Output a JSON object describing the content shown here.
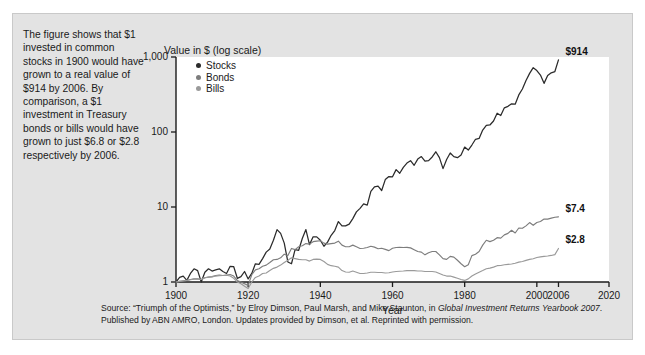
{
  "caption": {
    "text": "The figure shows that $1 invested in common stocks in 1900 would have grown to a real value of $914 by 2006.  By comparison, a $1 investment in Treasury bonds or bills would have grown to just $6.8 or $2.8 respectively by 2006."
  },
  "source": {
    "line1_a": "Source: “Triumph of the Optimists,” by Elroy Dimson, Paul Marsh, and Mike Staunton, in ",
    "line1_ital": "Global Investment Returns",
    "line2_ital": "Yearbook 2007",
    "line2_b": ". Published by ABN AMRO, London. Updates provided by Dimson, et al. Reprinted with permission."
  },
  "colors": {
    "stocks": "#2b2b2b",
    "bonds": "#7d7d7d",
    "bills": "#9a9a9a",
    "axis": "#1a1a1a",
    "figure_bg": "#e3e3e3",
    "plot_bg": "#ffffff"
  },
  "chart_data": {
    "type": "line",
    "title": "",
    "ylabel": "Value in $ (log scale)",
    "xlabel": "Year",
    "yscale": "log",
    "ylim": [
      1,
      1000
    ],
    "xlim": [
      1900,
      2020
    ],
    "grid": false,
    "legend_position": "top-left-inside",
    "ytick_labels": [
      "1,000",
      "100",
      "10",
      "1"
    ],
    "ytick_values": [
      1000,
      100,
      10,
      1
    ],
    "xtick_labels": [
      "1900",
      "1920",
      "1940",
      "1960",
      "1980",
      "2000",
      "2006",
      "2020"
    ],
    "xtick_values": [
      1900,
      1920,
      1940,
      1960,
      1980,
      2000,
      2006,
      2020
    ],
    "annotations": [
      {
        "text": "$914",
        "series": "Stocks",
        "x": 2006,
        "y": 914
      },
      {
        "text": "$7.4",
        "series": "Bonds",
        "x": 2006,
        "y": 7.4
      },
      {
        "text": "$2.8",
        "series": "Bills",
        "x": 2006,
        "y": 2.8
      }
    ],
    "legend": [
      {
        "label": "Stocks",
        "color": "#2b2b2b"
      },
      {
        "label": "Bonds",
        "color": "#7d7d7d"
      },
      {
        "label": "Bills",
        "color": "#9a9a9a"
      }
    ],
    "x": [
      1900,
      1901,
      1902,
      1903,
      1904,
      1905,
      1906,
      1907,
      1908,
      1909,
      1910,
      1911,
      1912,
      1913,
      1914,
      1915,
      1916,
      1917,
      1918,
      1919,
      1920,
      1921,
      1922,
      1923,
      1924,
      1925,
      1926,
      1927,
      1928,
      1929,
      1930,
      1931,
      1932,
      1933,
      1934,
      1935,
      1936,
      1937,
      1938,
      1939,
      1940,
      1941,
      1942,
      1943,
      1944,
      1945,
      1946,
      1947,
      1948,
      1949,
      1950,
      1951,
      1952,
      1953,
      1954,
      1955,
      1956,
      1957,
      1958,
      1959,
      1960,
      1961,
      1962,
      1963,
      1964,
      1965,
      1966,
      1967,
      1968,
      1969,
      1970,
      1971,
      1972,
      1973,
      1974,
      1975,
      1976,
      1977,
      1978,
      1979,
      1980,
      1981,
      1982,
      1983,
      1984,
      1985,
      1986,
      1987,
      1988,
      1989,
      1990,
      1991,
      1992,
      1993,
      1994,
      1995,
      1996,
      1997,
      1998,
      1999,
      2000,
      2001,
      2002,
      2003,
      2004,
      2005,
      2006
    ],
    "series": [
      {
        "name": "Stocks",
        "color": "#2b2b2b",
        "values": [
          1.0,
          1.15,
          1.2,
          1.05,
          1.3,
          1.5,
          1.42,
          1.0,
          1.35,
          1.5,
          1.4,
          1.45,
          1.5,
          1.38,
          1.3,
          1.62,
          1.6,
          1.12,
          1.18,
          1.38,
          1.1,
          1.3,
          1.75,
          1.72,
          2.05,
          2.5,
          2.75,
          3.6,
          5.0,
          4.45,
          3.3,
          1.85,
          1.75,
          2.7,
          2.65,
          3.8,
          5.0,
          3.15,
          4.0,
          4.0,
          3.6,
          3.0,
          3.4,
          4.2,
          4.85,
          6.4,
          5.6,
          5.6,
          5.9,
          7.0,
          8.6,
          9.6,
          11.0,
          10.6,
          16.2,
          18.6,
          19.0,
          16.6,
          23.2,
          25.5,
          25.3,
          31.5,
          28.2,
          33.8,
          38.5,
          41.5,
          36.0,
          43.5,
          47.0,
          41.0,
          41.5,
          46.5,
          54.5,
          45.5,
          32.5,
          43.0,
          52.5,
          47.0,
          45.5,
          49.5,
          63.0,
          57.5,
          67.0,
          80.0,
          82.0,
          106.0,
          123.0,
          124.0,
          140.0,
          178.0,
          166.0,
          210.0,
          220.0,
          238.0,
          235.0,
          312.0,
          375.0,
          485.0,
          605.0,
          720.0,
          660.0,
          575.0,
          445.0,
          565.0,
          615.0,
          640.0,
          914.0
        ]
      },
      {
        "name": "Bonds",
        "color": "#7d7d7d",
        "values": [
          1.0,
          1.02,
          1.04,
          1.05,
          1.08,
          1.1,
          1.1,
          1.08,
          1.14,
          1.16,
          1.18,
          1.22,
          1.24,
          1.22,
          1.24,
          1.26,
          1.2,
          1.05,
          1.0,
          0.95,
          0.9,
          1.25,
          1.45,
          1.5,
          1.62,
          1.68,
          1.82,
          1.98,
          2.0,
          2.1,
          2.35,
          2.25,
          2.8,
          2.7,
          2.95,
          3.05,
          3.25,
          3.2,
          3.45,
          3.5,
          3.55,
          3.3,
          3.2,
          3.25,
          3.3,
          3.5,
          3.1,
          2.95,
          2.95,
          3.1,
          2.95,
          2.8,
          2.82,
          2.88,
          3.0,
          2.92,
          2.78,
          2.82,
          2.72,
          2.62,
          2.82,
          2.88,
          2.9,
          2.88,
          2.9,
          2.85,
          2.7,
          2.55,
          2.5,
          2.3,
          2.45,
          2.55,
          2.55,
          2.3,
          2.05,
          2.0,
          2.2,
          2.15,
          1.95,
          1.75,
          1.6,
          1.7,
          2.25,
          2.35,
          2.55,
          3.1,
          3.6,
          3.45,
          3.6,
          3.9,
          3.85,
          4.25,
          4.45,
          4.9,
          4.5,
          5.25,
          5.2,
          5.6,
          6.2,
          5.7,
          6.2,
          6.4,
          6.9,
          6.9,
          7.1,
          7.3,
          7.4
        ]
      },
      {
        "name": "Bills",
        "color": "#9a9a9a",
        "values": [
          1.0,
          1.02,
          1.03,
          1.05,
          1.07,
          1.09,
          1.1,
          1.08,
          1.14,
          1.16,
          1.17,
          1.2,
          1.21,
          1.22,
          1.23,
          1.2,
          1.12,
          1.0,
          0.95,
          0.88,
          0.82,
          1.0,
          1.15,
          1.2,
          1.3,
          1.32,
          1.42,
          1.52,
          1.58,
          1.68,
          1.82,
          1.95,
          2.1,
          2.05,
          2.0,
          1.98,
          1.98,
          1.9,
          2.0,
          2.02,
          2.0,
          1.88,
          1.72,
          1.65,
          1.62,
          1.58,
          1.42,
          1.36,
          1.35,
          1.4,
          1.35,
          1.3,
          1.3,
          1.32,
          1.35,
          1.35,
          1.34,
          1.34,
          1.32,
          1.33,
          1.36,
          1.38,
          1.39,
          1.4,
          1.42,
          1.42,
          1.42,
          1.4,
          1.4,
          1.38,
          1.38,
          1.38,
          1.36,
          1.3,
          1.24,
          1.2,
          1.2,
          1.16,
          1.12,
          1.08,
          1.05,
          1.1,
          1.2,
          1.28,
          1.35,
          1.42,
          1.5,
          1.53,
          1.58,
          1.65,
          1.66,
          1.7,
          1.72,
          1.74,
          1.78,
          1.84,
          1.88,
          1.94,
          2.0,
          2.04,
          2.12,
          2.16,
          2.2,
          2.22,
          2.26,
          2.32,
          2.8
        ]
      }
    ]
  }
}
